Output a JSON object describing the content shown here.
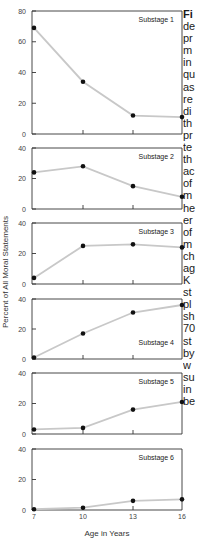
{
  "chart_data": [
    {
      "type": "line",
      "title": "Substage 1",
      "x": [
        7,
        10,
        13,
        16
      ],
      "values": [
        69,
        34,
        12,
        11
      ],
      "ylim": [
        0,
        80
      ],
      "yticks": [
        0,
        20,
        40,
        60,
        80
      ],
      "xlabel": "",
      "ylabel": ""
    },
    {
      "type": "line",
      "title": "Substage 2",
      "x": [
        7,
        10,
        13,
        16
      ],
      "values": [
        24,
        28,
        15,
        8
      ],
      "ylim": [
        0,
        40
      ],
      "yticks": [
        0,
        20,
        40
      ]
    },
    {
      "type": "line",
      "title": "Substage 3",
      "x": [
        7,
        10,
        13,
        16
      ],
      "values": [
        4,
        25,
        26,
        24
      ],
      "ylim": [
        0,
        40
      ],
      "yticks": [
        0,
        20,
        40
      ]
    },
    {
      "type": "line",
      "title": "Substage 4",
      "x": [
        7,
        10,
        13,
        16
      ],
      "values": [
        1,
        17,
        31,
        36
      ],
      "ylim": [
        0,
        40
      ],
      "yticks": [
        0,
        20,
        40
      ]
    },
    {
      "type": "line",
      "title": "Substage 5",
      "x": [
        7,
        10,
        13,
        16
      ],
      "values": [
        3,
        4,
        16,
        21
      ],
      "ylim": [
        0,
        40
      ],
      "yticks": [
        0,
        20,
        40
      ]
    },
    {
      "type": "line",
      "title": "Substage 6",
      "x": [
        7,
        10,
        13,
        16
      ],
      "values": [
        0.5,
        1.5,
        6,
        7
      ],
      "ylim": [
        0,
        40
      ],
      "yticks": [
        0,
        20,
        40
      ],
      "xticks": [
        "7",
        "10",
        "13",
        "16"
      ]
    }
  ],
  "axes": {
    "ylabel": "Percent of All Moral Statements",
    "xlabel": "Age in Years",
    "xticks": [
      "7",
      "10",
      "13",
      "16"
    ]
  },
  "style": {
    "line_color": "#c8c8c8",
    "marker_color": "#111111",
    "axis_color": "#333333",
    "text_color": "#1a1a1a"
  },
  "caption_fragments": [
    "Fi",
    "de",
    "pr",
    "m",
    "in",
    "qu",
    "as",
    "re",
    "di",
    "th",
    "pr",
    "te",
    "th",
    "ac",
    "of",
    "m",
    "he",
    "er",
    "of",
    "m",
    "ch",
    "ag",
    "K",
    "st",
    "pl",
    "sh",
    "70",
    "st",
    "by",
    "w",
    "su",
    "in",
    "be"
  ]
}
